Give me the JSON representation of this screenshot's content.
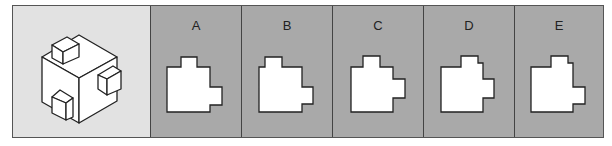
{
  "question": {
    "description": "Isometric cube with three small cubes attached",
    "stroke_color": "#222222",
    "background_color": "#e2e2e2"
  },
  "options": [
    {
      "label": "A",
      "shape": "167,67 181,67 181,57 197,57 197,67 210,67 210,87 222,87 222,105 210,105 210,112 167,112"
    },
    {
      "label": "B",
      "shape": "259,67 265,67 265,57 282,57 282,67 302,67 302,87 313,87 313,104 302,104 302,112 259,112"
    },
    {
      "label": "C",
      "shape": "351,67 363,67 363,56 380,56 380,67 393,67 393,79 405,79 405,98 393,98 393,112 351,112"
    },
    {
      "label": "D",
      "shape": "441,67 461,67 461,56 478,56 478,63 483,63 483,79 494,79 494,98 483,98 483,112 441,112"
    },
    {
      "label": "E",
      "shape": "531,67 551,67 551,56 568,56 568,63 573,63 573,87 585,87 585,104 573,104 573,112 531,112"
    }
  ],
  "colors": {
    "option_background": "#a9a9a9",
    "shape_fill": "#ffffff",
    "border": "#444444"
  }
}
